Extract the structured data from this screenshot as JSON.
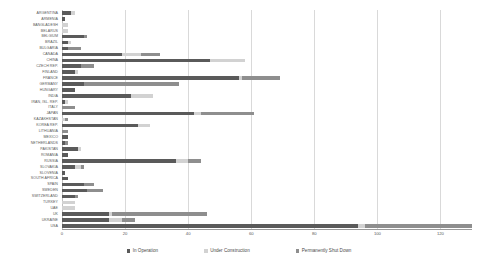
{
  "chart_data": {
    "type": "bar",
    "orientation": "horizontal",
    "stacked": true,
    "title": "",
    "xlabel": "",
    "ylabel": "",
    "xlim": [
      0,
      130
    ],
    "xticks": [
      0,
      20,
      40,
      60,
      80,
      100,
      120
    ],
    "grid": true,
    "legend_position": "bottom",
    "categories": [
      "ARGENTINA",
      "ARMENIA",
      "BANGLADESH",
      "BELARUS",
      "BELGIUM",
      "BRAZIL",
      "BULGARIA",
      "CANADA",
      "CHINA",
      "CZECH REP.",
      "FINLAND",
      "FRANCE",
      "GERMANY",
      "HUNGARY",
      "INDIA",
      "IRAN, ISL. REP.",
      "ITALY",
      "JAPAN",
      "KAZAKHSTAN",
      "KOREA REP.",
      "LITHUANIA",
      "MEXICO",
      "NETHERLANDS",
      "PAKISTAN",
      "ROMANIA",
      "RUSSIA",
      "SLOVAKIA",
      "SLOVENIA",
      "SOUTH AFRICA",
      "SPAIN",
      "SWEDEN",
      "SWITZERLAND",
      "TURKEY",
      "UAE",
      "UK",
      "UKRAINE",
      "USA"
    ],
    "series": [
      {
        "name": "In Operation",
        "color": "#5a5a5a",
        "values": [
          3,
          1,
          0,
          0,
          7,
          2,
          2,
          19,
          47,
          6,
          4,
          56,
          7,
          4,
          22,
          1,
          0,
          42,
          0,
          24,
          0,
          2,
          1,
          5,
          2,
          36,
          4,
          1,
          2,
          7,
          8,
          4,
          0,
          0,
          15,
          15,
          94
        ]
      },
      {
        "name": "Under Construction",
        "color": "#d2d2d2",
        "values": [
          1,
          0,
          2,
          2,
          0,
          1,
          0,
          6,
          11,
          0,
          1,
          1,
          0,
          0,
          7,
          1,
          0,
          2,
          1,
          4,
          0,
          0,
          0,
          1,
          0,
          4,
          2,
          0,
          0,
          0,
          0,
          0,
          4,
          4,
          1,
          4,
          2
        ]
      },
      {
        "name": "Permanently Shut Down",
        "color": "#8e8e8e",
        "values": [
          0,
          0,
          0,
          0,
          1,
          0,
          4,
          6,
          0,
          4,
          0,
          12,
          30,
          0,
          0,
          0,
          4,
          17,
          1,
          0,
          2,
          0,
          1,
          0,
          0,
          4,
          1,
          0,
          0,
          3,
          5,
          1,
          0,
          0,
          30,
          4,
          34
        ]
      }
    ]
  },
  "legend": {
    "items": [
      {
        "label": "In Operation",
        "key": "op"
      },
      {
        "label": "Under Construction",
        "key": "uc"
      },
      {
        "label": "Permanently Shut Down",
        "key": "sd"
      }
    ]
  }
}
